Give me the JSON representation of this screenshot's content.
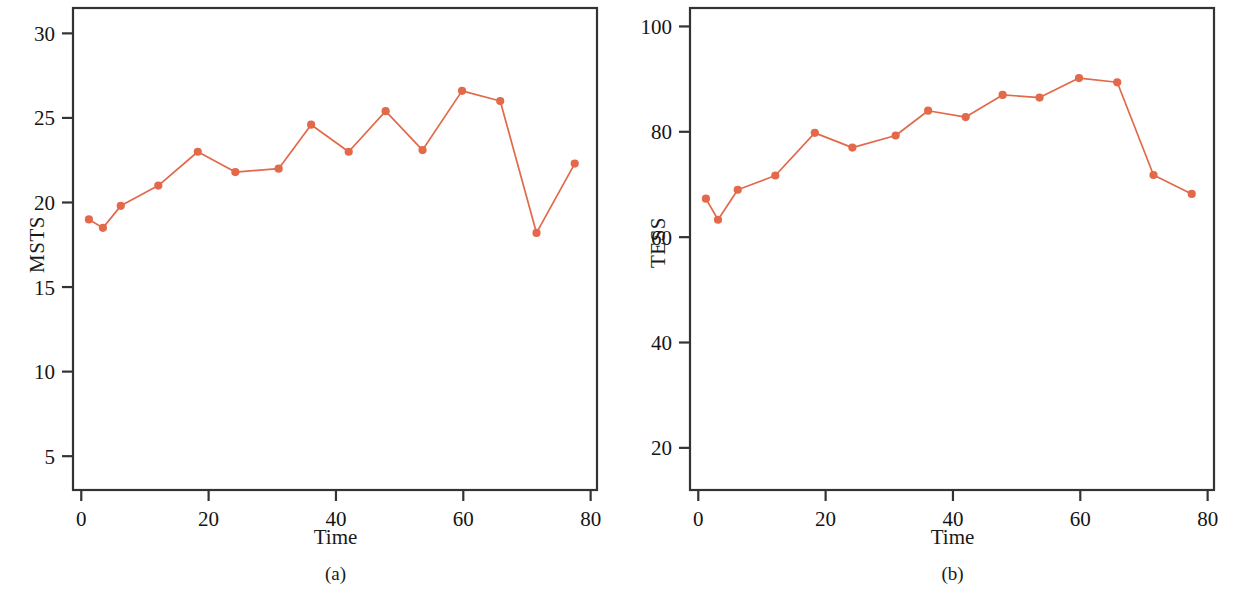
{
  "figure": {
    "background_color": "#ffffff",
    "series_color": "#E2694A",
    "axis_color": "#333333"
  },
  "panels": [
    {
      "id": "a",
      "caption": "(a)",
      "xlabel": "Time",
      "ylabel": "MSTS"
    },
    {
      "id": "b",
      "caption": "(b)",
      "xlabel": "Time",
      "ylabel": "TESS"
    }
  ],
  "chart_data": [
    {
      "type": "line",
      "title": "",
      "subtitle": "",
      "panel": "(a)",
      "xlabel": "Time",
      "ylabel": "MSTS",
      "xlim": [
        -1.3,
        81
      ],
      "ylim": [
        3.0,
        31.5
      ],
      "xticks": [
        0,
        20,
        40,
        60,
        80
      ],
      "xticklabels": [
        "0",
        "20",
        "40",
        "60",
        "80"
      ],
      "yticks": [
        5,
        10,
        15,
        20,
        25,
        30
      ],
      "yticklabels": [
        "5",
        "10",
        "15",
        "20",
        "25",
        "30"
      ],
      "grid": false,
      "legend": null,
      "markers": "filled-circle",
      "x": [
        1.2,
        3.4,
        6.2,
        12.1,
        18.3,
        24.2,
        31.0,
        36.1,
        42.0,
        47.8,
        53.6,
        59.8,
        65.8,
        71.5,
        77.5
      ],
      "y": [
        19.0,
        18.5,
        19.8,
        21.0,
        23.0,
        21.8,
        22.0,
        24.6,
        23.0,
        25.4,
        23.1,
        26.6,
        26.0,
        18.2,
        22.3
      ]
    },
    {
      "type": "line",
      "title": "",
      "subtitle": "",
      "panel": "(b)",
      "xlabel": "Time",
      "ylabel": "TESS",
      "xlim": [
        -1.3,
        81
      ],
      "ylim": [
        12.0,
        103.5
      ],
      "xticks": [
        0,
        20,
        40,
        60,
        80
      ],
      "xticklabels": [
        "0",
        "20",
        "40",
        "60",
        "80"
      ],
      "yticks": [
        20,
        40,
        60,
        80,
        100
      ],
      "yticklabels": [
        "20",
        "40",
        "60",
        "80",
        "100"
      ],
      "grid": false,
      "legend": null,
      "markers": "filled-circle",
      "x": [
        1.2,
        3.1,
        6.2,
        12.1,
        18.3,
        24.2,
        31.0,
        36.1,
        42.0,
        47.8,
        53.6,
        59.8,
        65.8,
        71.5,
        77.5
      ],
      "y": [
        67.3,
        63.3,
        69.0,
        71.7,
        79.8,
        77.0,
        79.3,
        84.0,
        82.8,
        87.0,
        86.5,
        90.2,
        89.4,
        71.8,
        68.2
      ]
    }
  ]
}
